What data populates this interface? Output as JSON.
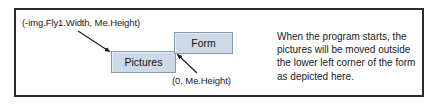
{
  "figure": {
    "labels": {
      "top_left_coordinate": "(-img.Fly1.Width, Me.Height)",
      "bottom_coordinate": "(0, Me.Height)"
    },
    "boxes": [
      {
        "id": "form",
        "label": "Form"
      },
      {
        "id": "pictures",
        "label": "Pictures"
      }
    ],
    "description": "When the program starts, the pictures will be moved outside the lower left corner of the form as depicted here.",
    "colors": {
      "box_fill": "#ccd9e6",
      "box_border": "#8c9aa8",
      "frame_border": "#2b2b2b",
      "text": "#1a1a1a",
      "background": "#ffffff"
    }
  }
}
